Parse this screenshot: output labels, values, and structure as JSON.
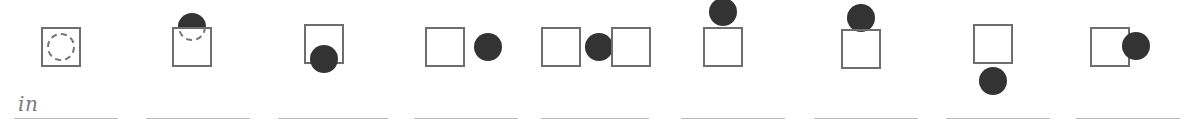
{
  "worksheet": {
    "type": "preposition-matching-exercise",
    "item_count": 10,
    "colors": {
      "box_stroke": "#6e6e6e",
      "ball_fill": "#333333",
      "dashed_stroke": "#777777",
      "answer_line": "#b9b9b9",
      "handwriting": "#7b7b7b",
      "background": "#ffffff"
    },
    "items": [
      {
        "index": 1,
        "answer_value": "in",
        "answer_placeholder": "",
        "figure": "ball-inside-box-dashed",
        "left": 8,
        "line_left": 6,
        "line_width": 104,
        "box": {
          "left": 33,
          "top": 27,
          "visible": true
        },
        "ball": {
          "type": "dashed",
          "left": 39,
          "top": 33
        }
      },
      {
        "index": 2,
        "answer_value": "",
        "answer_placeholder": "",
        "figure": "ball-emerging-from-top-of-box",
        "left": 140,
        "line_left": 6,
        "line_width": 104,
        "box": {
          "left": 32,
          "top": 27,
          "visible": true
        },
        "ball": {
          "type": "emerging",
          "left": 38,
          "top": 13
        }
      },
      {
        "index": 3,
        "answer_value": "",
        "answer_placeholder": "",
        "figure": "ball-at-bottom-edge-of-box",
        "left": 272,
        "line_left": 6,
        "line_width": 110,
        "box": {
          "left": 32,
          "top": 24,
          "visible": true
        },
        "ball": {
          "type": "solid",
          "left": 38,
          "top": 45
        }
      },
      {
        "index": 4,
        "answer_value": "",
        "answer_placeholder": "",
        "figure": "ball-beside-box-right",
        "left": 408,
        "line_left": 6,
        "line_width": 104,
        "box": {
          "left": 17,
          "top": 27,
          "visible": true
        },
        "ball": {
          "type": "solid",
          "left": 66,
          "top": 33
        }
      },
      {
        "index": 5,
        "answer_value": "",
        "answer_placeholder": "",
        "figure": "ball-between-two-boxes",
        "left": 535,
        "line_left": 6,
        "line_width": 108,
        "box": {
          "left": 6,
          "top": 27,
          "visible": true
        },
        "box2": {
          "left": 76,
          "top": 27,
          "visible": true
        },
        "ball": {
          "type": "solid",
          "left": 50,
          "top": 33
        }
      },
      {
        "index": 6,
        "answer_value": "",
        "answer_placeholder": "",
        "figure": "ball-above-box-gap",
        "left": 675,
        "line_left": 6,
        "line_width": 104,
        "box": {
          "left": 28,
          "top": 27,
          "visible": true
        },
        "ball": {
          "type": "solid",
          "left": 34,
          "top": -2
        }
      },
      {
        "index": 7,
        "answer_value": "",
        "answer_placeholder": "",
        "figure": "ball-on-top-of-box",
        "left": 808,
        "line_left": 6,
        "line_width": 104,
        "box": {
          "left": 33,
          "top": 29,
          "visible": true
        },
        "ball": {
          "type": "solid",
          "left": 39,
          "top": 4
        }
      },
      {
        "index": 8,
        "answer_value": "",
        "answer_placeholder": "",
        "figure": "ball-below-box-gap",
        "left": 940,
        "line_left": 6,
        "line_width": 104,
        "box": {
          "left": 33,
          "top": 24,
          "visible": true
        },
        "ball": {
          "type": "solid",
          "left": 39,
          "top": 67
        }
      },
      {
        "index": 9,
        "answer_value": "",
        "answer_placeholder": "",
        "figure": "ball-touching-right-edge-of-box",
        "left": 1070,
        "line_left": 6,
        "line_width": 104,
        "box": {
          "left": 20,
          "top": 27,
          "visible": true
        },
        "ball": {
          "type": "solid",
          "left": 52,
          "top": 32
        }
      }
    ]
  }
}
